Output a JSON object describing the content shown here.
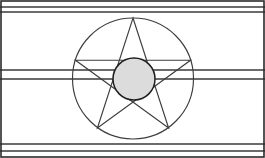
{
  "figure": {
    "canvas": {
      "width": 265,
      "height": 158,
      "background": "#ffffff"
    },
    "frame": {
      "name": "outer-border",
      "x": 1,
      "y": 1,
      "width": 263,
      "height": 156,
      "stroke": "#2b2b2b",
      "stroke_width": 1.6
    },
    "ruled_lines": [
      {
        "label": "top-rule-upper",
        "y": 7,
        "x1": 0,
        "x2": 265,
        "stroke": "#3a3a3a",
        "stroke_width": 1.4
      },
      {
        "label": "top-rule-lower",
        "y": 12,
        "x1": 0,
        "x2": 265,
        "stroke": "#3a3a3a",
        "stroke_width": 1.4
      },
      {
        "label": "mid-rule-upper",
        "y": 70,
        "x1": 0,
        "x2": 265,
        "stroke": "#3a3a3a",
        "stroke_width": 1.4
      },
      {
        "label": "mid-rule-lower",
        "y": 79,
        "x1": 0,
        "x2": 265,
        "stroke": "#3a3a3a",
        "stroke_width": 1.4
      },
      {
        "label": "bottom-rule-upper",
        "y": 144,
        "x1": 0,
        "x2": 265,
        "stroke": "#3a3a3a",
        "stroke_width": 1.4
      },
      {
        "label": "bottom-rule-lower",
        "y": 151,
        "x1": 0,
        "x2": 265,
        "stroke": "#3a3a3a",
        "stroke_width": 1.4
      }
    ],
    "outer_circle": {
      "label": "circumscribing-circle",
      "cx": 133,
      "cy": 78.5,
      "r": 60.5,
      "fill": "none",
      "stroke": "#3d3d3d",
      "stroke_width": 1.15
    },
    "star": {
      "label": "pentagram",
      "points_count": 5,
      "vertices": [
        {
          "name": "apex-top",
          "x": 133,
          "y": 18
        },
        {
          "name": "point-right",
          "x": 190.5,
          "y": 60.2
        },
        {
          "name": "point-bottom-right",
          "x": 168.6,
          "y": 128
        },
        {
          "name": "point-bottom-left",
          "x": 97.4,
          "y": 128
        },
        {
          "name": "point-left",
          "x": 75.5,
          "y": 60.2
        }
      ],
      "draw_order": [
        0,
        2,
        4,
        1,
        3
      ],
      "stroke": "#3d3d3d",
      "stroke_width": 1.15,
      "fill": "none"
    },
    "inner_circle": {
      "label": "center-disc",
      "cx": 134,
      "cy": 79,
      "r": 21,
      "fill": "#dcdcdc",
      "stroke": "#1f1f1f",
      "stroke_width": 1.5
    }
  }
}
